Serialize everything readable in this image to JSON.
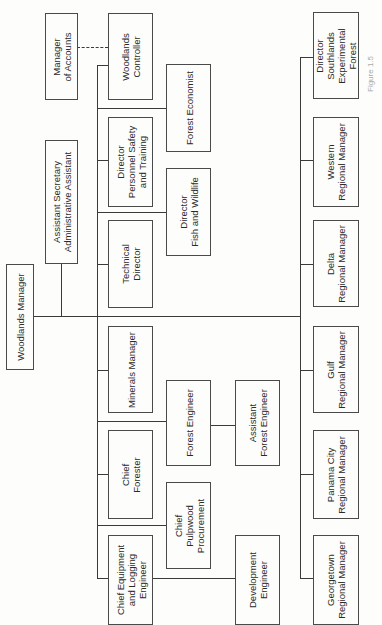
{
  "chart_title": "Woodlands organization chart (rotated)",
  "nodes": {
    "woodlands_manager": "Woodlands Manager",
    "assistant_secretary": "Assistant Secretary\nAdministrative Assistant",
    "manager_of_accounts": "Manager\nof Accounts",
    "woodlands_controller": "Woodlands\nController",
    "dir_personnel": "Director\nPersonnel Safety\nand Training",
    "technical_director": "Technical\nDirector",
    "minerals_manager": "Minerals Manager",
    "chief_forester": "Chief\nForester",
    "chief_equipment": "Chief Equipment\nand Logging\nEngineer",
    "forest_economist": "Forest Economist",
    "dir_fish_wildlife": "Director\nFish and Wildlife",
    "forest_engineer": "Forest Engineer",
    "chief_pulpwood": "Chief\nPulpwood\nProcurement",
    "asst_forest_engineer": "Assistant\nForest Engineer",
    "development_engineer": "Development\nEngineer",
    "dir_southlands": "Director\nSouthlands\nExperimental\nForest",
    "western_rm": "Western\nRegional Manager",
    "delta_rm": "Delta\nRegional Manager",
    "gulf_rm": "Gulf\nRegional Manager",
    "panama_city_rm": "Panama City\nRegional Manager",
    "georgetown_rm": "Georgetown\nRegional Manager"
  },
  "caption": "Figure 1.5"
}
